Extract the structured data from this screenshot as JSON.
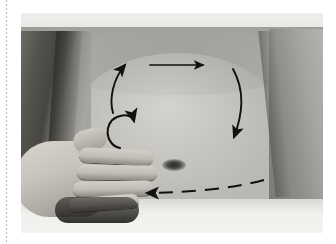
{
  "page": {
    "background_color": "#ffffff",
    "guide_rule": {
      "style": "dotted-vertical",
      "color": "#b9b9b9"
    }
  },
  "figure": {
    "type": "clinical-photograph",
    "color_mode": "grayscale",
    "border_color": "#c8c8c8",
    "frame": {
      "x": 21,
      "y": 13,
      "width": 302,
      "height": 220
    },
    "anatomy": [
      {
        "name": "drape-sheet-top",
        "label": "Sheet / drape (upper)"
      },
      {
        "name": "drape-sheet-bottom",
        "label": "Sheet / drape (lower)"
      },
      {
        "name": "torso",
        "label": "Abdomen"
      },
      {
        "name": "navel",
        "label": "Umbilicus"
      },
      {
        "name": "arm-left",
        "label": "Patient left arm"
      },
      {
        "name": "arm-right",
        "label": "Patient right arm"
      },
      {
        "name": "practitioner-hand",
        "label": "Practitioner hand"
      }
    ],
    "annotations": {
      "ink_color": "#111111",
      "arrows": [
        {
          "name": "arrow-ascending-colon",
          "label": "Ascending colon stroke (upward)",
          "shape": "curve",
          "direction": "up",
          "path": "M 92 100 C 88 86, 92 66, 104 52",
          "head_at": [
            104,
            52
          ]
        },
        {
          "name": "arrow-transverse-colon",
          "label": "Transverse colon stroke (rightward)",
          "shape": "straight",
          "direction": "right",
          "path": "M 129 52 L 182 52",
          "head_at": [
            184,
            52
          ]
        },
        {
          "name": "arrow-descending-colon",
          "label": "Descending colon stroke (downward)",
          "shape": "curve",
          "direction": "down",
          "path": "M 212 56 C 224 78, 222 100, 213 124",
          "head_at": [
            212,
            127
          ]
        },
        {
          "name": "arrow-caecum-hook",
          "label": "Caecum circular stroke (counterclockwise hook)",
          "shape": "c-curve",
          "direction": "counterclockwise",
          "path": "M 99 135 C 84 132, 82 110, 96 104 C 106 100, 112 104, 113 108",
          "head_at": [
            115,
            107
          ]
        },
        {
          "name": "arrow-sigmoid-dashed",
          "label": "Sigmoid / evacuation stroke (leftward, dashed)",
          "shape": "dashed",
          "direction": "left",
          "path": "M 243 167 C 210 176, 160 180, 126 180",
          "head_at": [
            122,
            180
          ],
          "dash_pattern": "14 9",
          "dash_count": 4
        }
      ]
    }
  }
}
